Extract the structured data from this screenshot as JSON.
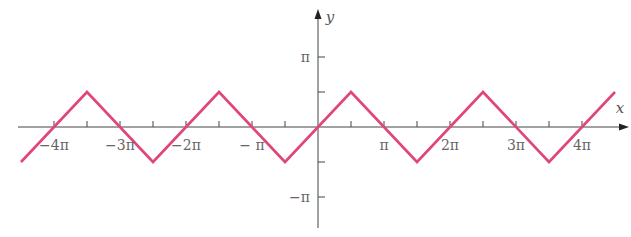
{
  "chart_data": {
    "type": "line",
    "title": "",
    "xlabel": "x",
    "ylabel": "y",
    "xlim": [
      -4.55,
      4.5
    ],
    "ylim": [
      -1.6,
      1.7
    ],
    "units": "multiples of pi",
    "x_ticks": [
      -4,
      -3.5,
      -3,
      -2.5,
      -2,
      -1.5,
      -1,
      -0.5,
      0.5,
      1,
      1.5,
      2,
      2.5,
      3,
      3.5,
      4
    ],
    "x_tick_labels": [
      {
        "value": -4,
        "text": "−4π"
      },
      {
        "value": -3,
        "text": "−3π"
      },
      {
        "value": -2,
        "text": "−2π"
      },
      {
        "value": -1,
        "text": "− π"
      },
      {
        "value": 1,
        "text": "π"
      },
      {
        "value": 2,
        "text": "2π"
      },
      {
        "value": 3,
        "text": "3π"
      },
      {
        "value": 4,
        "text": "4π"
      }
    ],
    "y_ticks": [
      -1,
      -0.5,
      0.5,
      1
    ],
    "y_tick_labels": [
      {
        "value": 1,
        "text": "π"
      },
      {
        "value": -1,
        "text": "−π"
      }
    ],
    "series": [
      {
        "name": "y = arcsin(sin x)",
        "color": "#e0457b",
        "x": [
          -4.5,
          -3.5,
          -2.5,
          -1.5,
          -0.5,
          0.5,
          1.5,
          2.5,
          3.5,
          4.5
        ],
        "y": [
          -0.5,
          0.5,
          -0.5,
          0.5,
          -0.5,
          0.5,
          -0.5,
          0.5,
          -0.5,
          0.5
        ]
      }
    ],
    "grid": false,
    "legend": "none"
  },
  "axes": {
    "x_label": "x",
    "y_label": "y",
    "axis_color": "#444444"
  }
}
